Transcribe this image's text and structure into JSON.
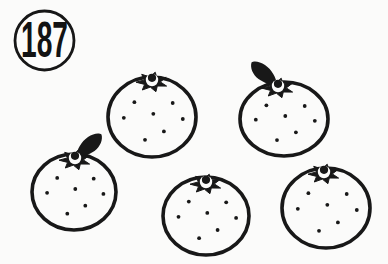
{
  "badge": {
    "label": "187"
  },
  "scene": {
    "subject": "five-oranges-line-drawing",
    "fruit_count": 5,
    "ink_color": "#181818",
    "paper_color": "#fbfbfa",
    "outline_width": 3.6,
    "dot_radius": 1.9,
    "dot_pattern": [
      [
        -0.4,
        -0.37
      ],
      [
        0.47,
        -0.35
      ],
      [
        -0.64,
        0.02
      ],
      [
        0.03,
        -0.08
      ],
      [
        0.7,
        0.05
      ],
      [
        0.27,
        0.36
      ],
      [
        -0.16,
        0.57
      ]
    ],
    "fruits": [
      {
        "name": "orange-top-middle",
        "cx": 152,
        "cy": 117,
        "rx": 44,
        "ry": 40,
        "calyx": [
          152,
          82
        ],
        "leaf": null
      },
      {
        "name": "orange-top-right",
        "cx": 284,
        "cy": 119,
        "rx": 44,
        "ry": 37,
        "calyx": [
          278,
          88
        ],
        "leaf": "up-left"
      },
      {
        "name": "orange-bottom-left",
        "cx": 74,
        "cy": 192,
        "rx": 42,
        "ry": 38,
        "calyx": [
          75,
          160
        ],
        "leaf": "up-right"
      },
      {
        "name": "orange-bottom-middle",
        "cx": 206,
        "cy": 216,
        "rx": 43,
        "ry": 39,
        "calyx": [
          206,
          184
        ],
        "leaf": null
      },
      {
        "name": "orange-bottom-right",
        "cx": 326,
        "cy": 208,
        "rx": 44,
        "ry": 40,
        "calyx": [
          324,
          174
        ],
        "leaf": null
      }
    ]
  }
}
